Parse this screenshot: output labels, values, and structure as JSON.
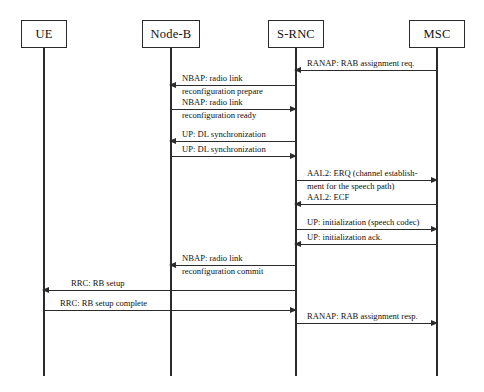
{
  "diagram": {
    "type": "sequence-diagram",
    "background_color": "#ffffff",
    "line_color": "#2b2b2b",
    "text_color": "#111111"
  },
  "actors": [
    {
      "id": "ue",
      "label": "UE"
    },
    {
      "id": "nodeb",
      "label": "Node-B"
    },
    {
      "id": "srnc",
      "label": "S-RNC"
    },
    {
      "id": "msc",
      "label": "MSC"
    }
  ],
  "messages": [
    {
      "id": "m1",
      "from": "msc",
      "to": "srnc",
      "direction": "left",
      "line1": "RANAP: RAB assignment req.",
      "line2": ""
    },
    {
      "id": "m2",
      "from": "srnc",
      "to": "nodeb",
      "direction": "left",
      "line1": "NBAP: radio link",
      "line2": "reconfiguration prepare"
    },
    {
      "id": "m3",
      "from": "nodeb",
      "to": "srnc",
      "direction": "right",
      "line1": "NBAP: radio link",
      "line2": "reconfiguration ready"
    },
    {
      "id": "m4",
      "from": "srnc",
      "to": "nodeb",
      "direction": "left",
      "line1": "UP: DL synchronization",
      "line2": ""
    },
    {
      "id": "m5",
      "from": "nodeb",
      "to": "srnc",
      "direction": "right",
      "line1": "UP: DL synchronization",
      "line2": ""
    },
    {
      "id": "m6",
      "from": "srnc",
      "to": "msc",
      "direction": "right",
      "line1": "AAL2: ERQ (channel establish-",
      "line2": "ment for the speech path)"
    },
    {
      "id": "m7",
      "from": "msc",
      "to": "srnc",
      "direction": "left",
      "line1": "AAL2: ECF",
      "line2": ""
    },
    {
      "id": "m8",
      "from": "srnc",
      "to": "msc",
      "direction": "right",
      "line1": "UP: initialization (speech codec)",
      "line2": ""
    },
    {
      "id": "m9",
      "from": "msc",
      "to": "srnc",
      "direction": "left",
      "line1": "UP: initialization ack.",
      "line2": ""
    },
    {
      "id": "m10",
      "from": "srnc",
      "to": "nodeb",
      "direction": "left",
      "line1": "NBAP: radio link",
      "line2": "reconfiguration commit"
    },
    {
      "id": "m11",
      "from": "srnc",
      "to": "ue",
      "direction": "left",
      "line1": "RRC: RB setup",
      "line2": ""
    },
    {
      "id": "m12",
      "from": "ue",
      "to": "srnc",
      "direction": "right",
      "line1": "RRC: RB setup complete",
      "line2": ""
    },
    {
      "id": "m13",
      "from": "srnc",
      "to": "msc",
      "direction": "right",
      "line1": "RANAP: RAB assignment resp.",
      "line2": ""
    }
  ]
}
